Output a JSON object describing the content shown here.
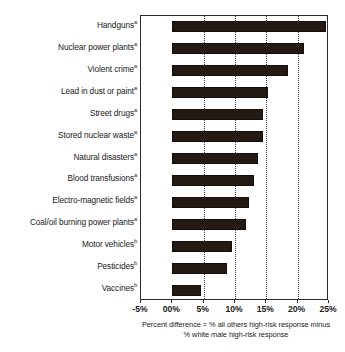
{
  "chart_data": {
    "type": "bar",
    "orientation": "horizontal",
    "title": "",
    "subtitle": "",
    "xlabel": "Percent difference = % all others high-risk response minus % white male high-risk response",
    "ylabel": "",
    "xlim": [
      -5,
      25
    ],
    "xticks": [
      -5,
      0,
      5,
      10,
      15,
      20,
      25
    ],
    "xticklabels": [
      "-5%",
      "00%",
      "5%",
      "10%",
      "15%",
      "20%",
      "25%"
    ],
    "grid": "vertical-dotted",
    "legend": "none",
    "categories": [
      "Handguns",
      "Nuclear power plants",
      "Violent crime",
      "Lead in dust or paint",
      "Street drugs",
      "Stored nuclear waste",
      "Natural disasters",
      "Blood transfusions",
      "Electro-magnetic fields",
      "Coal/oil burning power plants",
      "Motor vehicles",
      "Pesticides",
      "Vaccines"
    ],
    "category_footnotes": [
      "a",
      "a",
      "a",
      "a",
      "a",
      "a",
      "a",
      "a",
      "a",
      "a",
      "b",
      "b",
      "b"
    ],
    "values": [
      24.5,
      21.0,
      18.5,
      15.3,
      14.5,
      14.5,
      13.6,
      13.0,
      12.3,
      11.8,
      9.5,
      8.7,
      4.6
    ],
    "bar_color": "#231a14"
  },
  "axis": {
    "tick_labels": [
      "-5%",
      "00%",
      "5%",
      "10%",
      "15%",
      "20%",
      "25%"
    ],
    "caption_line_1": "Percent difference = % all others high-risk response minus",
    "caption_line_2": "% white male high-risk response"
  },
  "categories": [
    {
      "label": "Handguns",
      "sup": "a",
      "value": 24.5
    },
    {
      "label": "Nuclear power plants",
      "sup": "a",
      "value": 21.0
    },
    {
      "label": "Violent crime",
      "sup": "a",
      "value": 18.5
    },
    {
      "label": "Lead in dust or paint",
      "sup": "a",
      "value": 15.3
    },
    {
      "label": "Street drugs",
      "sup": "a",
      "value": 14.5
    },
    {
      "label": "Stored nuclear waste",
      "sup": "a",
      "value": 14.5
    },
    {
      "label": "Natural disasters",
      "sup": "a",
      "value": 13.6
    },
    {
      "label": "Blood transfusions",
      "sup": "a",
      "value": 13.0
    },
    {
      "label": "Electro-magnetic fields",
      "sup": "a",
      "value": 12.3
    },
    {
      "label": "Coal/oil burning power plants",
      "sup": "a",
      "value": 11.8
    },
    {
      "label": "Motor vehicles",
      "sup": "b",
      "value": 9.5
    },
    {
      "label": "Pesticides",
      "sup": "b",
      "value": 8.7
    },
    {
      "label": "Vaccines",
      "sup": "b",
      "value": 4.6
    }
  ]
}
